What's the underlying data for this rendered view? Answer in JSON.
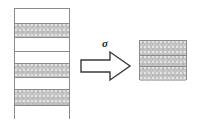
{
  "figure": {
    "background_color": "#ffffff",
    "width": 199,
    "height": 126
  },
  "palette": {
    "stroke": "#8a8a8a",
    "arrow_stroke": "#3a3a3a",
    "shaded_fill": "#c2c2c2",
    "white_fill": "#ffffff",
    "label_color": "#1a1a1a"
  },
  "left_stack": {
    "label": "layered-medium-stack",
    "band_count": 8,
    "bands": [
      {
        "index": 0,
        "fill": "white",
        "height_px": 14,
        "separator": false
      },
      {
        "index": 1,
        "fill": "shaded",
        "height_px": 14,
        "separator": true
      },
      {
        "index": 2,
        "fill": "white",
        "height_px": 14,
        "separator": true
      },
      {
        "index": 3,
        "fill": "white",
        "height_px": 12,
        "separator": true
      },
      {
        "index": 4,
        "fill": "shaded",
        "height_px": 14,
        "separator": true
      },
      {
        "index": 5,
        "fill": "white",
        "height_px": 12,
        "separator": true
      },
      {
        "index": 6,
        "fill": "shaded",
        "height_px": 16,
        "separator": true
      },
      {
        "index": 7,
        "fill": "white",
        "height_px": 15,
        "separator": true
      }
    ]
  },
  "arrow": {
    "label": "σ",
    "label_name": "sigma-symbol",
    "direction": "right",
    "style": "outlined-block-arrow"
  },
  "right_block": {
    "label": "homogenized-block",
    "band_count": 3,
    "bands": [
      {
        "index": 0,
        "fill": "shaded",
        "height_px": 14,
        "separator": false
      },
      {
        "index": 1,
        "fill": "shaded",
        "height_px": 11,
        "separator": true
      },
      {
        "index": 2,
        "fill": "shaded",
        "height_px": 15,
        "separator": true
      }
    ]
  }
}
